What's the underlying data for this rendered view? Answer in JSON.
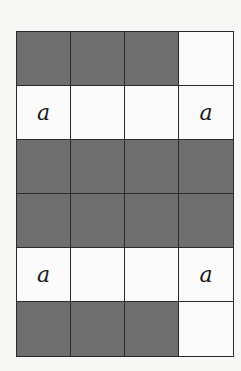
{
  "diagram": {
    "rows": 6,
    "cols": 4,
    "colors": {
      "shaded": "#6e6e6e",
      "white": "#fbfbfb",
      "line": "#2a2a2a"
    },
    "cells": [
      [
        {
          "shaded": true,
          "label": ""
        },
        {
          "shaded": true,
          "label": ""
        },
        {
          "shaded": true,
          "label": ""
        },
        {
          "shaded": false,
          "label": ""
        }
      ],
      [
        {
          "shaded": false,
          "label": "a"
        },
        {
          "shaded": false,
          "label": ""
        },
        {
          "shaded": false,
          "label": ""
        },
        {
          "shaded": false,
          "label": "a"
        }
      ],
      [
        {
          "shaded": true,
          "label": ""
        },
        {
          "shaded": true,
          "label": ""
        },
        {
          "shaded": true,
          "label": ""
        },
        {
          "shaded": true,
          "label": ""
        }
      ],
      [
        {
          "shaded": true,
          "label": ""
        },
        {
          "shaded": true,
          "label": ""
        },
        {
          "shaded": true,
          "label": ""
        },
        {
          "shaded": true,
          "label": ""
        }
      ],
      [
        {
          "shaded": false,
          "label": "a"
        },
        {
          "shaded": false,
          "label": ""
        },
        {
          "shaded": false,
          "label": ""
        },
        {
          "shaded": false,
          "label": "a"
        }
      ],
      [
        {
          "shaded": true,
          "label": ""
        },
        {
          "shaded": true,
          "label": ""
        },
        {
          "shaded": true,
          "label": ""
        },
        {
          "shaded": false,
          "label": ""
        }
      ]
    ]
  }
}
